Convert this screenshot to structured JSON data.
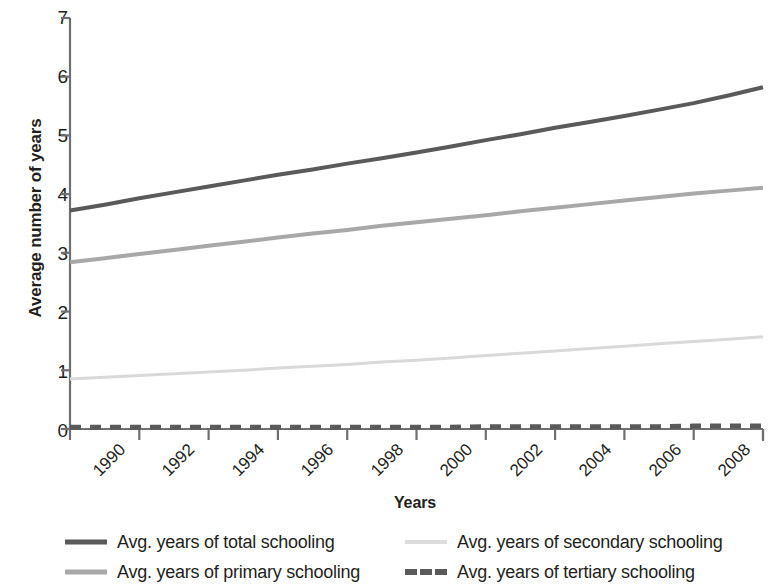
{
  "chart_data": {
    "type": "line",
    "title": "",
    "xlabel": "Years",
    "ylabel": "Average number of years",
    "xlim": [
      1990,
      2010
    ],
    "ylim": [
      0,
      7
    ],
    "grid": false,
    "legend_position": "bottom",
    "x": [
      1990,
      1991,
      1992,
      1993,
      1994,
      1995,
      1996,
      1997,
      1998,
      1999,
      2000,
      2001,
      2002,
      2003,
      2004,
      2005,
      2006,
      2007,
      2008,
      2009,
      2010
    ],
    "xticks": [
      "1990",
      "1992",
      "1994",
      "1996",
      "1998",
      "2000",
      "2002",
      "2004",
      "2006",
      "2008",
      "2010"
    ],
    "yticks": [
      "0",
      "1",
      "2",
      "3",
      "4",
      "5",
      "6",
      "7"
    ],
    "series": [
      {
        "name": "Avg. years of total schooling",
        "color": "#5a5a5a",
        "style": "solid",
        "width": 4,
        "values": [
          3.72,
          3.82,
          3.93,
          4.03,
          4.13,
          4.23,
          4.33,
          4.42,
          4.52,
          4.61,
          4.71,
          4.81,
          4.92,
          5.02,
          5.13,
          5.23,
          5.33,
          5.44,
          5.55,
          5.68,
          5.82
        ]
      },
      {
        "name": "Avg. years of primary schooling",
        "color": "#a8a8a8",
        "style": "solid",
        "width": 4,
        "values": [
          2.84,
          2.91,
          2.98,
          3.05,
          3.12,
          3.19,
          3.26,
          3.33,
          3.39,
          3.46,
          3.52,
          3.58,
          3.64,
          3.71,
          3.77,
          3.83,
          3.89,
          3.95,
          4.01,
          4.06,
          4.11
        ]
      },
      {
        "name": "Avg. years of secondary schooling",
        "color": "#d9d9d9",
        "style": "solid",
        "width": 3,
        "values": [
          0.85,
          0.88,
          0.91,
          0.94,
          0.97,
          1.0,
          1.04,
          1.07,
          1.1,
          1.14,
          1.17,
          1.21,
          1.25,
          1.29,
          1.33,
          1.37,
          1.41,
          1.45,
          1.49,
          1.53,
          1.57
        ]
      },
      {
        "name": "Avg. years of tertiary schooling",
        "color": "#5a5a5a",
        "style": "dashed",
        "width": 5,
        "values": [
          0.03,
          0.03,
          0.03,
          0.03,
          0.03,
          0.03,
          0.03,
          0.03,
          0.03,
          0.03,
          0.03,
          0.03,
          0.04,
          0.04,
          0.04,
          0.04,
          0.04,
          0.04,
          0.05,
          0.05,
          0.05
        ]
      }
    ]
  },
  "axis": {
    "y_title": "Average number of years",
    "x_title": "Years",
    "y_ticks": [
      "7",
      "6",
      "5",
      "4",
      "3",
      "2",
      "1",
      "0"
    ],
    "x_ticks": [
      "1990",
      "1992",
      "1994",
      "1996",
      "1998",
      "2000",
      "2002",
      "2004",
      "2006",
      "2008",
      "2010"
    ]
  },
  "legend": {
    "items": [
      {
        "label": "Avg. years of total schooling",
        "color": "#5a5a5a",
        "style": "solid"
      },
      {
        "label": "Avg. years of primary schooling",
        "color": "#a8a8a8",
        "style": "solid"
      },
      {
        "label": "Avg. years of secondary schooling",
        "color": "#d9d9d9",
        "style": "solid"
      },
      {
        "label": "Avg. years of tertiary schooling",
        "color": "#5a5a5a",
        "style": "dashed"
      }
    ]
  }
}
